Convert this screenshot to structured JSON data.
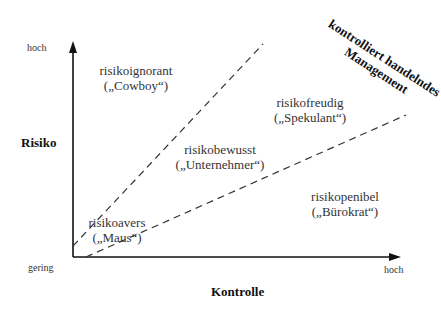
{
  "y_axis": {
    "title": "Risiko",
    "high_label": "hoch",
    "low_label": "gering"
  },
  "x_axis": {
    "title": "Kontrolle",
    "high_label": "hoch"
  },
  "regions": [
    {
      "name": "risikoignorant",
      "alias": "(„Cowboy“)"
    },
    {
      "name": "risikobewusst",
      "alias": "(„Unternehmer“)"
    },
    {
      "name": "risikofreudig",
      "alias": "(„Spekulant“)"
    },
    {
      "name": "risikopenibel",
      "alias": "(„Bürokrat“)"
    },
    {
      "name": "risikoavers",
      "alias": "(„Maus“)"
    }
  ],
  "diagonal_label": {
    "line1": "kontrolliert handelndes",
    "line2": "Management"
  },
  "colors": {
    "axis": "#111111",
    "dashed_line": "#333333",
    "text": "#333333"
  }
}
